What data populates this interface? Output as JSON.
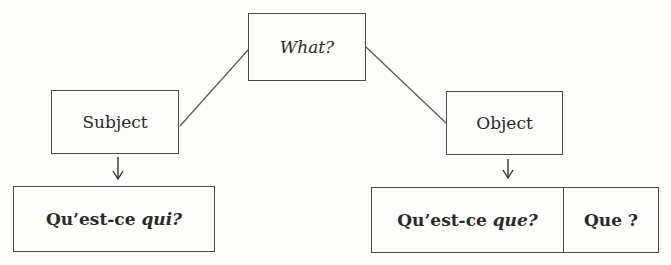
{
  "diagram": {
    "root": {
      "label": "What?"
    },
    "subject": {
      "label": "Subject"
    },
    "object": {
      "label": "Object"
    },
    "subject_form": {
      "prefix": "Qu’est-ce ",
      "italic": "qui?"
    },
    "object_forms": [
      {
        "prefix": "Qu’est-ce ",
        "italic": "que?"
      },
      {
        "prefix": "Que ?",
        "italic": ""
      }
    ],
    "arrow_glyph": "↓",
    "line_color": "#4a4a4a"
  }
}
